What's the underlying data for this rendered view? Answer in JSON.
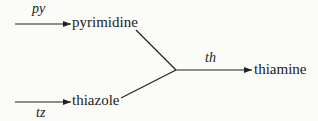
{
  "diagram": {
    "nodes": {
      "pyrimidine": "pyrimidine",
      "thiazole": "thiazole",
      "thiamine": "thiamine"
    },
    "edges": {
      "py": "py",
      "tz": "tz",
      "th": "th"
    },
    "colors": {
      "line": "#222222",
      "background": "#fbfbf8"
    }
  }
}
